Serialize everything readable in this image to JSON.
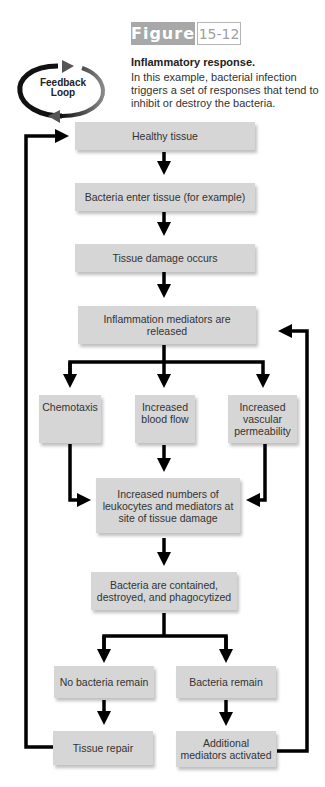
{
  "figure": {
    "label": "Figure",
    "number": "15-12",
    "title": "Inflammatory response.",
    "caption": "In this example, bacterial infection triggers a set of responses that tend to inhibit or destroy the bacteria."
  },
  "feedback_loop": {
    "line1": "Feedback",
    "line2": "Loop"
  },
  "nodes": {
    "healthy": "Healthy tissue",
    "bacteria_enter": "Bacteria enter tissue (for example)",
    "damage": "Tissue damage occurs",
    "mediators": "Inflammation mediators are released",
    "chemotaxis": "Chemotaxis",
    "blood_flow": "Increased blood flow",
    "permeability": "Increased vascular permeability",
    "leukocytes": "Increased numbers of leukocytes and mediators at site of tissue damage",
    "contained": "Bacteria are contained, destroyed, and phagocytized",
    "no_bacteria": "No bacteria remain",
    "bacteria_remain": "Bacteria remain",
    "repair": "Tissue repair",
    "additional": "Additional mediators activated"
  },
  "colors": {
    "box": "#d6d6d6",
    "arrow": "#000000",
    "tag": "#a8a8a8"
  }
}
